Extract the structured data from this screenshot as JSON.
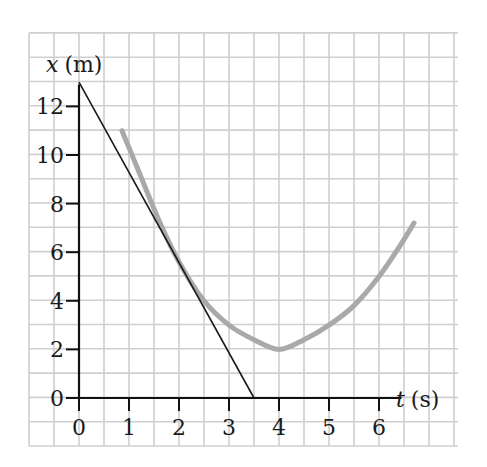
{
  "chart_data": {
    "type": "line",
    "title": "",
    "xlabel": "t (s)",
    "ylabel": "x (m)",
    "xlabel_var": "t",
    "xlabel_unit": "(s)",
    "ylabel_var": "x",
    "ylabel_unit": "(m)",
    "xlim": [
      0,
      7.5
    ],
    "ylim": [
      0,
      13
    ],
    "x_ticks": [
      0,
      1,
      2,
      3,
      4,
      5,
      6
    ],
    "y_ticks": [
      0,
      2,
      4,
      6,
      8,
      10,
      12
    ],
    "grid": true,
    "grid_spacing": {
      "x": 0.5,
      "y": 1
    },
    "series": [
      {
        "name": "position curve x(t)",
        "style": "thick gray curve",
        "color": "#a9a9a9",
        "x": [
          0.86,
          1.2,
          1.6,
          2.0,
          2.5,
          3.0,
          3.5,
          4.0,
          4.5,
          5.0,
          5.5,
          6.0,
          6.4,
          6.7
        ],
        "y": [
          11.0,
          9.3,
          7.3,
          5.6,
          4.0,
          3.0,
          2.4,
          2.0,
          2.4,
          3.0,
          3.8,
          5.0,
          6.2,
          7.2
        ]
      },
      {
        "name": "tangent line at t = 2 s",
        "style": "thin black line",
        "color": "#1a1a1a",
        "x": [
          0,
          3.5
        ],
        "y": [
          13,
          0
        ]
      }
    ],
    "annotations": []
  },
  "labels": {
    "x_ticks": [
      "0",
      "1",
      "2",
      "3",
      "4",
      "5",
      "6"
    ],
    "y_ticks": [
      "0",
      "2",
      "4",
      "6",
      "8",
      "10",
      "12"
    ]
  }
}
